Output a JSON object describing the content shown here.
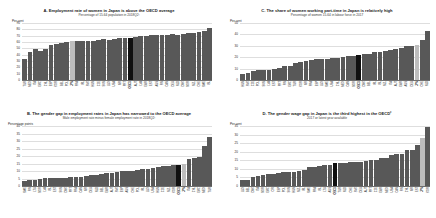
{
  "figure": {
    "highlight_japan_color": "#bdbdbd",
    "highlight_oecd_color": "#101010",
    "bar_color": "#585858"
  },
  "panels": [
    {
      "key": "A",
      "title": "A. Employment rate of women in Japan is above the OECD average",
      "subtitle": "Percentage of 15-64 population in 2018Q2¹",
      "yunit": "Per cent"
    },
    {
      "key": "B",
      "title": "B. The gender gap in employment rates in Japan has narrowed to the OECD average",
      "subtitle": "Male employment rate minus female employment rate in 2018Q2¹",
      "yunit": "Percentage points"
    },
    {
      "key": "C",
      "title": "C. The share of women working part-time in Japan is relatively high",
      "subtitle": "Percentage of women 15-64 in labour force in 2017",
      "yunit": "Per cent"
    },
    {
      "key": "D",
      "title": "D. The gender wage gap in Japan is the third highest in the OECD²",
      "subtitle": "2017 or latest year available",
      "yunit": "Per cent"
    }
  ],
  "chart_data": [
    {
      "type": "bar",
      "panel": "A",
      "title": "A. Employment rate of women in Japan is above the OECD average",
      "subtitle": "Percentage of 15-64 population in 2018Q2¹",
      "xlabel": "",
      "ylabel": "Per cent",
      "ylim": [
        0,
        90
      ],
      "yticks": [
        0,
        10,
        20,
        30,
        40,
        50,
        60,
        70,
        80,
        90
      ],
      "grid": true,
      "legend": "none",
      "highlight": {
        "japan": "JPN",
        "oecd": "OECD"
      },
      "categories": [
        "TUR",
        "MEX",
        "ITA",
        "GRC",
        "CHL",
        "ESP",
        "KOR",
        "BEL",
        "POL",
        "JPN",
        "FRA",
        "IRL",
        "SVK",
        "HUN",
        "CZE",
        "SVN",
        "LUX",
        "USA",
        "ISR",
        "PRT",
        "OECD",
        "AUT",
        "LVA",
        "GBR",
        "EST",
        "AUS",
        "FIN",
        "CAN",
        "DEU",
        "NLD",
        "DNK",
        "NOR",
        "NZL",
        "CHE",
        "SWE",
        "ISL"
      ],
      "values": [
        33.5,
        45.0,
        49.5,
        45.5,
        48.5,
        55.0,
        57.0,
        58.5,
        60.0,
        61.5,
        61.5,
        61.0,
        61.5,
        61.5,
        63.0,
        64.0,
        63.5,
        64.5,
        66.0,
        66.5,
        67.0,
        68.5,
        69.5,
        70.0,
        71.5,
        70.5,
        71.0,
        70.5,
        72.0,
        71.5,
        72.5,
        73.5,
        74.5,
        76.0,
        77.0,
        82.0
      ]
    },
    {
      "type": "bar",
      "panel": "B",
      "title": "B. The gender gap in employment rates in Japan has narrowed to the OECD average",
      "subtitle": "Male employment rate minus female employment rate in 2018Q2¹",
      "xlabel": "",
      "ylabel": "Percentage points",
      "ylim": [
        0,
        40
      ],
      "yticks": [
        0,
        5,
        10,
        15,
        20,
        25,
        30,
        35,
        40
      ],
      "grid": true,
      "legend": "none",
      "highlight": {
        "japan": "JPN",
        "oecd": "OECD"
      },
      "categories": [
        "SWE",
        "FIN",
        "LTU",
        "NOR",
        "LVA",
        "ISL",
        "EST",
        "SVN",
        "DNK",
        "PRT",
        "FRA",
        "CAN",
        "ISR",
        "DEU",
        "NLD",
        "BEL",
        "GBR",
        "AUT",
        "SVK",
        "ESP",
        "AUS",
        "CHE",
        "POL",
        "IRL",
        "LUX",
        "USA",
        "HUN",
        "CZE",
        "NZL",
        "KOR",
        "OECD",
        "JPN",
        "ITA",
        "CHL",
        "GRC",
        "MEX",
        "TUR"
      ],
      "values": [
        3.5,
        3.8,
        4.2,
        5.0,
        5.2,
        5.2,
        5.3,
        5.4,
        5.6,
        5.8,
        6.0,
        6.2,
        6.5,
        7.2,
        7.6,
        8.0,
        8.4,
        8.6,
        9.2,
        9.8,
        10.0,
        10.2,
        10.6,
        11.2,
        11.4,
        11.8,
        12.4,
        13.2,
        13.6,
        14.0,
        14.2,
        14.6,
        18.0,
        18.4,
        19.2,
        26.5,
        32.5
      ]
    },
    {
      "type": "bar",
      "panel": "C",
      "title": "C. The share of women working part-time in Japan is relatively high",
      "subtitle": "Percentage of women 15-64 in labour force in 2017",
      "xlabel": "",
      "ylabel": "Per cent",
      "ylim": [
        0,
        50
      ],
      "yticks": [
        0,
        10,
        20,
        30,
        40,
        50
      ],
      "grid": true,
      "legend": "none",
      "highlight": {
        "japan": "JPN",
        "oecd": "OECD"
      },
      "categories": [
        "HUN",
        "SVK",
        "CZE",
        "POL",
        "SVN",
        "LVA",
        "EST",
        "PRT",
        "FIN",
        "GRC",
        "TUR",
        "KOR",
        "ISR",
        "FRA",
        "ESP",
        "LUX",
        "SWE",
        "USA",
        "CHL",
        "MEX",
        "CAN",
        "NOR",
        "OECD",
        "DNK",
        "BEL",
        "IRL",
        "ISL",
        "NZL",
        "ITA",
        "AUT",
        "GBR",
        "AUS",
        "DEU",
        "JPN",
        "CHE",
        "NLD"
      ],
      "values": [
        5.0,
        6.2,
        7.5,
        8.4,
        9.0,
        9.2,
        9.6,
        10.8,
        12.2,
        12.6,
        15.0,
        16.2,
        16.8,
        17.4,
        18.0,
        18.4,
        18.6,
        19.0,
        19.2,
        20.4,
        21.0,
        21.4,
        22.0,
        22.6,
        23.0,
        24.4,
        25.0,
        25.6,
        26.0,
        27.0,
        28.0,
        30.0,
        30.2,
        30.4,
        35.0,
        43.0
      ]
    },
    {
      "type": "bar",
      "panel": "D",
      "title": "D. The gender wage gap in Japan is the third highest in the OECD²",
      "subtitle": "2017 or latest year available",
      "xlabel": "",
      "ylabel": "Per cent",
      "ylim": [
        0,
        35
      ],
      "yticks": [
        0,
        5,
        10,
        15,
        20,
        25,
        30,
        35
      ],
      "grid": true,
      "legend": "none",
      "highlight": {
        "japan": "JPN",
        "oecd": "OECD"
      },
      "categories": [
        "LUX",
        "BEL",
        "DNK",
        "ITA",
        "NOR",
        "GRC",
        "CRI",
        "ESP",
        "POL",
        "SVN",
        "HUN",
        "NZL",
        "IRL",
        "SWE",
        "FRA",
        "ISL",
        "LTU",
        "AUS",
        "OECD",
        "TUR",
        "NLD",
        "CHE",
        "SVK",
        "DEU",
        "AUT",
        "PRT",
        "CZE",
        "GBR",
        "MEX",
        "USA",
        "CAN",
        "FIN",
        "CHL",
        "ISR",
        "EST",
        "JPN",
        "KOR"
      ],
      "values": [
        3.4,
        3.6,
        5.2,
        5.6,
        6.4,
        6.8,
        7.0,
        7.6,
        8.0,
        8.2,
        8.4,
        8.6,
        9.3,
        11.0,
        11.2,
        11.5,
        12.0,
        12.4,
        13.2,
        13.4,
        13.6,
        13.8,
        14.0,
        14.2,
        14.4,
        15.0,
        15.4,
        16.2,
        16.4,
        18.2,
        18.4,
        18.6,
        20.8,
        21.0,
        24.2,
        28.0,
        34.5
      ]
    }
  ]
}
